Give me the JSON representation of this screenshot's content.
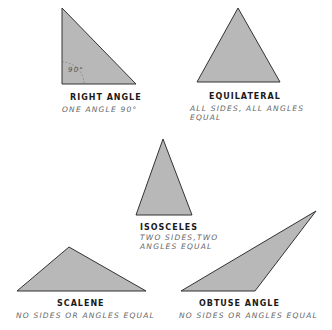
{
  "colors": {
    "fill": "#b8b8b8",
    "stroke": "#333333",
    "label": "#1a1a1a",
    "desc": "#666666"
  },
  "triangles": [
    {
      "name": "RIGHT ANGLE",
      "desc_line1": "ONE ANGLE 90°",
      "desc_line2": "",
      "angle_mark": "90°"
    },
    {
      "name": "EQUILATERAL",
      "desc_line1": "ALL SIDES, ALL ANGLES",
      "desc_line2": "EQUAL"
    },
    {
      "name": "ISOSCELES",
      "desc_line1": "TWO SIDES,TWO",
      "desc_line2": "ANGLES EQUAL"
    },
    {
      "name": "SCALENE",
      "desc_line1": "NO SIDES OR ANGLES EQUAL",
      "desc_line2": ""
    },
    {
      "name": "OBTUSE ANGLE",
      "desc_line1": "NO SIDES OR ANGLES EQUAL",
      "desc_line2": ""
    }
  ]
}
